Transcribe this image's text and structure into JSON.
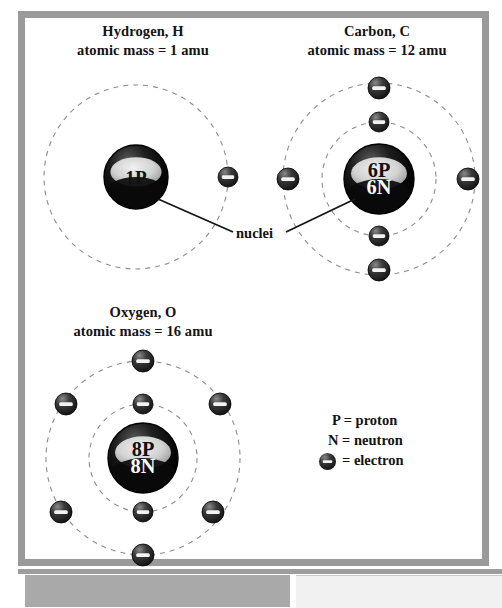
{
  "figure": {
    "title_hydrogen_line1": "Hydrogen, H",
    "title_hydrogen_line2": "atomic mass = 1 amu",
    "title_carbon_line1": "Carbon, C",
    "title_carbon_line2": "atomic mass = 12 amu",
    "title_oxygen_line1": "Oxygen, O",
    "title_oxygen_line2": "atomic mass = 16 amu",
    "callout_nuclei": "nuclei"
  },
  "legend": {
    "proton": "P = proton",
    "neutron": "N = neutron",
    "electron": "= electron",
    "electron_symbol": "electron-glyph"
  },
  "colors": {
    "frame": "#9a9a9a",
    "nucleus_dark": "#050505",
    "nucleus_band": "#d8d8d8",
    "electron_body": "#2c2c2c",
    "electron_bar": "#f2f2f2",
    "orbit_dash": "#8d8d8d",
    "text": "#131313",
    "bottom_bar_left": "#a9a9a9",
    "bottom_bar_right": "#f1f1f1"
  },
  "atoms": [
    {
      "name": "hydrogen",
      "symbol": "H",
      "atomic_mass": 1,
      "mass_unit": "amu",
      "nucleus_label_line1": "1P",
      "nucleus_label_line2": "",
      "protons": 1,
      "neutrons": 0,
      "nucleus": {
        "cx": 136,
        "cy": 177,
        "r": 32
      },
      "shells": [
        {
          "r": 92,
          "electrons": 1
        }
      ],
      "electrons": [
        {
          "cx": 228,
          "cy": 177,
          "r": 10,
          "shell": 1
        }
      ]
    },
    {
      "name": "carbon",
      "symbol": "C",
      "atomic_mass": 12,
      "mass_unit": "amu",
      "nucleus_label_line1": "6P",
      "nucleus_label_line2": "6N",
      "protons": 6,
      "neutrons": 6,
      "nucleus": {
        "cx": 379,
        "cy": 179,
        "r": 35
      },
      "shells": [
        {
          "r": 57,
          "electrons": 2
        },
        {
          "r": 96,
          "electrons": 4
        }
      ],
      "electrons": [
        {
          "cx": 379,
          "cy": 122,
          "r": 10,
          "shell": 1
        },
        {
          "cx": 379,
          "cy": 236,
          "r": 10,
          "shell": 1
        },
        {
          "cx": 379,
          "cy": 88,
          "r": 11,
          "shell": 2
        },
        {
          "cx": 379,
          "cy": 270,
          "r": 11,
          "shell": 2
        },
        {
          "cx": 288,
          "cy": 179,
          "r": 11,
          "shell": 2
        },
        {
          "cx": 468,
          "cy": 179,
          "r": 11,
          "shell": 2
        }
      ]
    },
    {
      "name": "oxygen",
      "symbol": "O",
      "atomic_mass": 16,
      "mass_unit": "amu",
      "nucleus_label_line1": "8P",
      "nucleus_label_line2": "8N",
      "protons": 8,
      "neutrons": 8,
      "nucleus": {
        "cx": 143,
        "cy": 458,
        "r": 35
      },
      "shells": [
        {
          "r": 54,
          "electrons": 2
        },
        {
          "r": 97,
          "electrons": 6
        }
      ],
      "electrons": [
        {
          "cx": 143,
          "cy": 404,
          "r": 10,
          "shell": 1
        },
        {
          "cx": 143,
          "cy": 512,
          "r": 10,
          "shell": 1
        },
        {
          "cx": 143,
          "cy": 361,
          "r": 11,
          "shell": 2
        },
        {
          "cx": 143,
          "cy": 555,
          "r": 11,
          "shell": 2
        },
        {
          "cx": 66,
          "cy": 404,
          "r": 11,
          "shell": 2
        },
        {
          "cx": 220,
          "cy": 404,
          "r": 11,
          "shell": 2
        },
        {
          "cx": 61,
          "cy": 512,
          "r": 11,
          "shell": 2
        },
        {
          "cx": 213,
          "cy": 512,
          "r": 11,
          "shell": 2
        }
      ]
    }
  ],
  "leader_lines": [
    {
      "name": "nuclei-to-hydrogen",
      "x1": 158,
      "y1": 199,
      "x2": 233,
      "y2": 232
    },
    {
      "name": "nuclei-to-carbon",
      "x1": 355,
      "y1": 199,
      "x2": 286,
      "y2": 232
    }
  ]
}
